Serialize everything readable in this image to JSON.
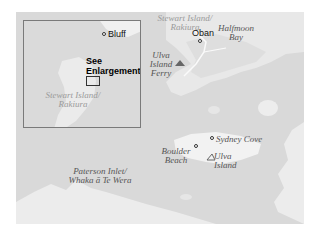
{
  "map": {
    "colors": {
      "water": "#d9d9d9",
      "land": "#ececec",
      "inset_border": "#7a7a7a"
    },
    "inset": {
      "towns": [
        {
          "label": "Bluff"
        }
      ],
      "region_label_line1": "Stewart Island/",
      "region_label_line2": "Rakiura",
      "callout_line1": "See",
      "callout_line2": "Enlargement"
    },
    "labels": {
      "stewart_island_line1": "Stewart Island/",
      "stewart_island_line2": "Rakiura",
      "halfmoon_bay_line1": "Halfmoon",
      "halfmoon_bay_line2": "Bay",
      "oban": "Oban",
      "ulva_ferry_line1": "Ulva",
      "ulva_ferry_line2": "Island",
      "ulva_ferry_line3": "Ferry",
      "sydney_cove": "Sydney Cove",
      "boulder_beach_line1": "Boulder",
      "boulder_beach_line2": "Beach",
      "ulva_island_line1": "Ulva",
      "ulva_island_line2": "Island",
      "paterson_inlet_line1": "Paterson Inlet/",
      "paterson_inlet_line2": "Whaka ā Te Wera"
    },
    "icons": [
      "town-dot",
      "ferry-icon",
      "beach-icon",
      "landing-icon"
    ]
  }
}
